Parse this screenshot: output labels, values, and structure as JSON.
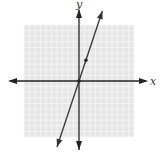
{
  "chart_data": {
    "type": "line",
    "title": "",
    "xlabel": "x",
    "ylabel": "y",
    "xlim": [
      -8,
      8
    ],
    "ylim": [
      -8,
      8
    ],
    "grid": true,
    "series": [
      {
        "name": "y = 3x",
        "slope": 3,
        "intercept": 0,
        "color": "#333333"
      }
    ],
    "points": [
      {
        "x": 0,
        "y": 0
      },
      {
        "x": 1,
        "y": 3
      }
    ]
  },
  "colors": {
    "grid_bg": "#e6e6e6",
    "grid_line": "#f7f7f7",
    "axis": "#222222",
    "line": "#333333"
  },
  "labels": {
    "x": "x",
    "y": "y"
  }
}
